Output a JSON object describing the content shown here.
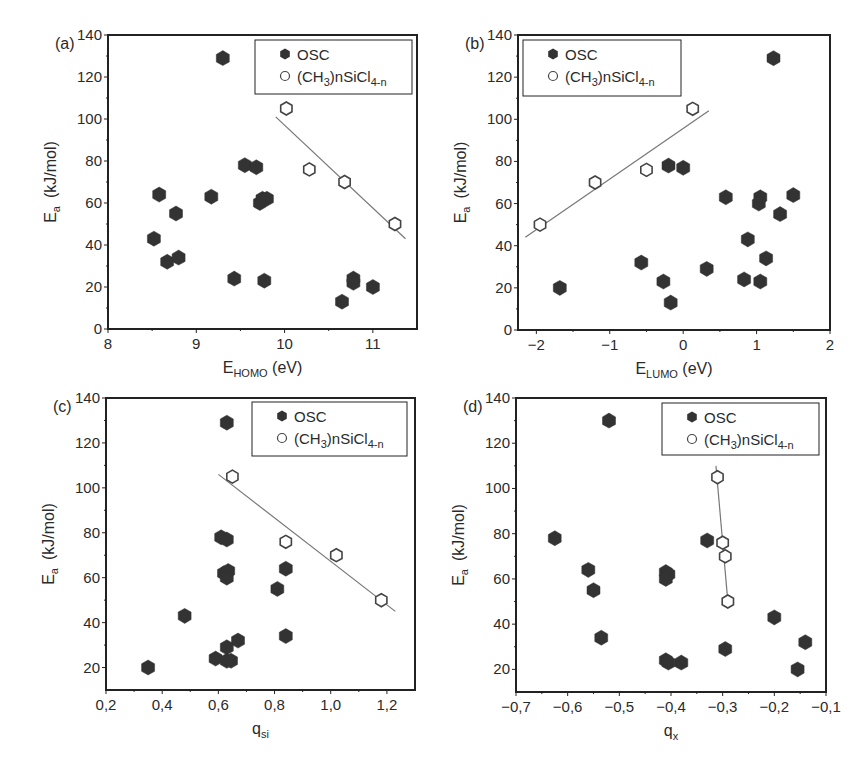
{
  "figure": {
    "width": 865,
    "height": 777,
    "colors": {
      "osc_fill": "#333333",
      "open_stroke": "#444444",
      "fit_line": "#777777",
      "axis": "#222222",
      "background": "#ffffff"
    }
  },
  "chart_data": [
    {
      "panel": "(a)",
      "type": "scatter",
      "title": "",
      "xlabel": "E_HOMO (eV)",
      "xlabel_main": "E",
      "xlabel_sub": "HOMO",
      "xlabel_unit": " (eV)",
      "ylabel": "E_a (kJ/mol)",
      "xlim": [
        8,
        11.5
      ],
      "ylim": [
        0,
        140
      ],
      "xticks": [
        8,
        9,
        10,
        11
      ],
      "xtick_labels": [
        "8",
        "9",
        "10",
        "11"
      ],
      "yticks": [
        0,
        20,
        40,
        60,
        80,
        100,
        120,
        140
      ],
      "ytick_labels": [
        "0",
        "20",
        "40",
        "60",
        "80",
        "100",
        "120",
        "140"
      ],
      "grid": false,
      "legend_position": "upper right",
      "box": {
        "left": 108,
        "top": 35,
        "right": 417,
        "bottom": 329
      },
      "legend_box": {
        "x": 255,
        "y": 40,
        "w": 157,
        "h": 54
      },
      "series": [
        {
          "name": "OSC",
          "marker": "filled-hexagon",
          "points": [
            [
              9.3,
              129
            ],
            [
              8.58,
              64
            ],
            [
              8.52,
              43
            ],
            [
              8.77,
              55
            ],
            [
              8.67,
              32
            ],
            [
              8.8,
              34
            ],
            [
              9.17,
              63
            ],
            [
              9.55,
              78
            ],
            [
              9.68,
              77
            ],
            [
              9.72,
              60
            ],
            [
              9.75,
              62
            ],
            [
              9.8,
              62
            ],
            [
              9.43,
              24
            ],
            [
              9.77,
              23
            ],
            [
              10.65,
              13
            ],
            [
              10.78,
              24
            ],
            [
              10.78,
              22
            ],
            [
              11.0,
              20
            ]
          ]
        },
        {
          "name": "(CH3)nSiCl4-n",
          "marker": "open-hexagon",
          "points": [
            [
              10.02,
              105
            ],
            [
              10.28,
              76
            ],
            [
              10.68,
              70
            ],
            [
              11.25,
              50
            ]
          ],
          "fit_line": [
            [
              9.9,
              101
            ],
            [
              11.37,
              43
            ]
          ]
        }
      ]
    },
    {
      "panel": "(b)",
      "type": "scatter",
      "title": "",
      "xlabel": "E_LUMO (eV)",
      "xlabel_main": "E",
      "xlabel_sub": "LUMO",
      "xlabel_unit": " (eV)",
      "ylabel": "E_a (kJ/mol)",
      "xlim": [
        -2.25,
        2
      ],
      "ylim": [
        0,
        140
      ],
      "xticks": [
        -2,
        -1,
        0,
        1,
        2
      ],
      "xtick_labels": [
        "−2",
        "−1",
        "0",
        "1",
        "2"
      ],
      "yticks": [
        0,
        20,
        40,
        60,
        80,
        100,
        120,
        140
      ],
      "ytick_labels": [
        "0",
        "20",
        "40",
        "60",
        "80",
        "100",
        "120",
        "140"
      ],
      "grid": false,
      "legend_position": "upper left",
      "box": {
        "left": 518,
        "top": 35,
        "right": 830,
        "bottom": 330
      },
      "legend_box": {
        "x": 523,
        "y": 40,
        "w": 158,
        "h": 56
      },
      "series": [
        {
          "name": "OSC",
          "marker": "filled-hexagon",
          "points": [
            [
              1.23,
              129
            ],
            [
              -0.2,
              78
            ],
            [
              0.0,
              77
            ],
            [
              0.58,
              63
            ],
            [
              1.05,
              63
            ],
            [
              1.03,
              60
            ],
            [
              1.5,
              64
            ],
            [
              1.32,
              55
            ],
            [
              0.88,
              43
            ],
            [
              1.13,
              34
            ],
            [
              -0.57,
              32
            ],
            [
              0.32,
              29
            ],
            [
              -0.27,
              23
            ],
            [
              0.83,
              24
            ],
            [
              1.05,
              23
            ],
            [
              -0.17,
              13
            ],
            [
              -1.68,
              20
            ]
          ]
        },
        {
          "name": "(CH3)nSiCl4-n",
          "marker": "open-hexagon",
          "points": [
            [
              -1.95,
              50
            ],
            [
              -1.2,
              70
            ],
            [
              -0.5,
              76
            ],
            [
              0.13,
              105
            ]
          ],
          "fit_line": [
            [
              -2.15,
              44
            ],
            [
              0.35,
              104
            ]
          ]
        }
      ]
    },
    {
      "panel": "(c)",
      "type": "scatter",
      "title": "",
      "xlabel": "q_si",
      "xlabel_main": "q",
      "xlabel_sub": "si",
      "xlabel_unit": "",
      "ylabel": "E_a (kJ/mol)",
      "xlim": [
        0.2,
        1.3
      ],
      "ylim": [
        10,
        140
      ],
      "xticks": [
        0.2,
        0.4,
        0.6,
        0.8,
        1.0,
        1.2
      ],
      "xtick_labels": [
        "0,2",
        "0,4",
        "0,6",
        "0,8",
        "1,0",
        "1,2"
      ],
      "yticks": [
        20,
        40,
        60,
        80,
        100,
        120,
        140
      ],
      "ytick_labels": [
        "20",
        "40",
        "60",
        "80",
        "100",
        "120",
        "140"
      ],
      "grid": false,
      "legend_position": "upper right",
      "box": {
        "left": 106,
        "top": 398,
        "right": 415,
        "bottom": 690
      },
      "legend_box": {
        "x": 252,
        "y": 402,
        "w": 155,
        "h": 54
      },
      "series": [
        {
          "name": "OSC",
          "marker": "filled-hexagon",
          "points": [
            [
              0.63,
              129
            ],
            [
              0.61,
              78
            ],
            [
              0.63,
              77
            ],
            [
              0.62,
              62
            ],
            [
              0.635,
              63
            ],
            [
              0.63,
              60
            ],
            [
              0.84,
              64
            ],
            [
              0.81,
              55
            ],
            [
              0.48,
              43
            ],
            [
              0.84,
              34
            ],
            [
              0.67,
              32
            ],
            [
              0.63,
              29
            ],
            [
              0.59,
              24
            ],
            [
              0.63,
              23
            ],
            [
              0.645,
              23
            ],
            [
              0.35,
              20
            ]
          ]
        },
        {
          "name": "(CH3)nSiCl4-n",
          "marker": "open-hexagon",
          "points": [
            [
              0.65,
              105
            ],
            [
              0.84,
              76
            ],
            [
              1.02,
              70
            ],
            [
              1.18,
              50
            ]
          ],
          "fit_line": [
            [
              0.6,
              106
            ],
            [
              1.23,
              45
            ]
          ]
        }
      ]
    },
    {
      "panel": "(d)",
      "type": "scatter",
      "title": "",
      "xlabel": "q_x",
      "xlabel_main": "q",
      "xlabel_sub": "x",
      "xlabel_unit": "",
      "ylabel": "E_a (kJ/mol)",
      "xlim": [
        -0.7,
        -0.1
      ],
      "ylim": [
        10,
        140
      ],
      "xticks": [
        -0.7,
        -0.6,
        -0.5,
        -0.4,
        -0.3,
        -0.2,
        -0.1
      ],
      "xtick_labels": [
        "−0,7",
        "−0,6",
        "−0,5",
        "−0,4",
        "−0,3",
        "−0,2",
        "−0,1"
      ],
      "yticks": [
        20,
        40,
        60,
        80,
        100,
        120,
        140
      ],
      "ytick_labels": [
        "20",
        "40",
        "60",
        "80",
        "100",
        "120",
        "140"
      ],
      "grid": false,
      "legend_position": "upper right",
      "box": {
        "left": 516,
        "top": 398,
        "right": 826,
        "bottom": 692
      },
      "legend_box": {
        "x": 662,
        "y": 403,
        "w": 157,
        "h": 52
      },
      "series": [
        {
          "name": "OSC",
          "marker": "filled-hexagon",
          "points": [
            [
              -0.52,
              130
            ],
            [
              -0.625,
              78
            ],
            [
              -0.33,
              77
            ],
            [
              -0.56,
              64
            ],
            [
              -0.55,
              55
            ],
            [
              -0.41,
              63
            ],
            [
              -0.405,
              62
            ],
            [
              -0.41,
              60
            ],
            [
              -0.535,
              34
            ],
            [
              -0.41,
              24
            ],
            [
              -0.405,
              23
            ],
            [
              -0.38,
              23
            ],
            [
              -0.295,
              29
            ],
            [
              -0.2,
              43
            ],
            [
              -0.14,
              32
            ],
            [
              -0.155,
              20
            ]
          ]
        },
        {
          "name": "(CH3)nSiCl4-n",
          "marker": "open-hexagon",
          "points": [
            [
              -0.31,
              105
            ],
            [
              -0.3,
              76
            ],
            [
              -0.295,
              70
            ],
            [
              -0.29,
              50
            ]
          ],
          "fit_line": [
            [
              -0.313,
              110
            ],
            [
              -0.29,
              50
            ]
          ]
        }
      ]
    }
  ],
  "legend": {
    "osc_label": "OSC",
    "ch3_prefix": "(CH",
    "ch3_sub1": "3",
    "ch3_mid": ")nSiCl",
    "ch3_sub2": "4-n"
  },
  "y_axis_title": {
    "main": "E",
    "sub": "a",
    "unit": "(kJ/mol)"
  }
}
